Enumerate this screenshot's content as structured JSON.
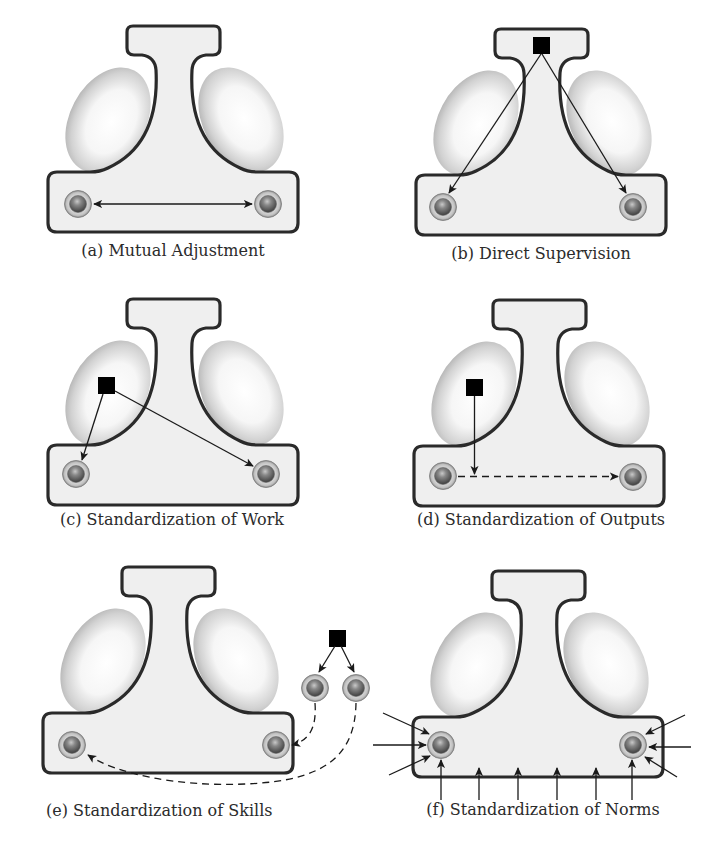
{
  "figure": {
    "type": "organizational coordination mechanisms",
    "panels": [
      {
        "id": "a",
        "caption": "(a) Mutual Adjustment",
        "mechanism": "mutual-adjustment",
        "coordinator": null,
        "connections": [
          {
            "from": "operator-left",
            "to": "operator-right",
            "style": "solid",
            "bidirectional": true
          }
        ]
      },
      {
        "id": "b",
        "caption": "(b) Direct Supervision",
        "mechanism": "direct-supervision",
        "coordinator": "strategic-apex",
        "connections": [
          {
            "from": "coordinator",
            "to": "operator-left",
            "style": "solid"
          },
          {
            "from": "coordinator",
            "to": "operator-right",
            "style": "solid"
          }
        ]
      },
      {
        "id": "c",
        "caption": "(c) Standardization of Work",
        "mechanism": "standardization-of-work",
        "coordinator": "technostructure",
        "connections": [
          {
            "from": "coordinator",
            "to": "operator-left",
            "style": "solid"
          },
          {
            "from": "coordinator",
            "to": "operator-right",
            "style": "solid"
          }
        ]
      },
      {
        "id": "d",
        "caption": "(d) Standardization of Outputs",
        "mechanism": "standardization-of-outputs",
        "coordinator": "technostructure",
        "connections": [
          {
            "from": "coordinator",
            "to": "output-flow",
            "style": "solid"
          },
          {
            "from": "operator-left",
            "to": "operator-right",
            "style": "dashed"
          }
        ]
      },
      {
        "id": "e",
        "caption": "(e) Standardization of Skills",
        "mechanism": "standardization-of-skills",
        "coordinator": "external-trainer",
        "connections": [
          {
            "from": "coordinator",
            "to": "trainee-1",
            "style": "solid"
          },
          {
            "from": "coordinator",
            "to": "trainee-2",
            "style": "solid"
          },
          {
            "from": "trainee-1",
            "to": "operator-right",
            "style": "dashed"
          },
          {
            "from": "trainee-2",
            "to": "operator-left",
            "style": "dashed"
          }
        ]
      },
      {
        "id": "f",
        "caption": "(f) Standardization of Norms",
        "mechanism": "standardization-of-norms",
        "coordinator": null,
        "connections": [
          {
            "from": "environment",
            "to": "operator-left",
            "style": "solid",
            "count": 3
          },
          {
            "from": "environment",
            "to": "operator-right",
            "style": "solid",
            "count": 3
          },
          {
            "from": "environment",
            "to": "operating-core",
            "style": "solid",
            "count": 6
          }
        ]
      }
    ]
  },
  "colors": {
    "outline": "#2a2a2a",
    "body_fill": "#efefef",
    "lobe_center": "#ffffff",
    "lobe_edge": "#b5b5b5",
    "node_ring": "#b0b0b0",
    "node_core": "#5a5a5a",
    "coordinator": "#000000",
    "caption_text": "#2b2b2b"
  }
}
